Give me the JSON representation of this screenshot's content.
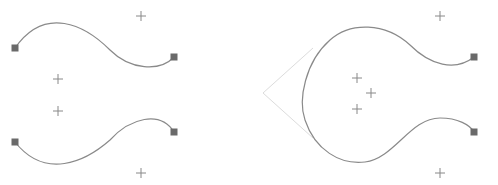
{
  "diagram": {
    "colors": {
      "curve": "#8a8a8a",
      "anchor": "#6a6a6a",
      "control_cross": "#888888",
      "guide_line": "#d8d8d8",
      "background": "#ffffff"
    },
    "left_panel": {
      "curves": [
        {
          "p0": [
            15,
            48
          ],
          "c1": [
            57,
            -10
          ],
          "c2": [
            140,
            107
          ],
          "p1": [
            174,
            57
          ],
          "path": "M15,48 C45,5 85,25 110,50 C130,70 160,72 174,57"
        },
        {
          "p0": [
            15,
            142
          ],
          "c1": [
            57,
            195
          ],
          "c2": [
            140,
            80
          ],
          "p1": [
            174,
            132
          ],
          "path": "M15,142 C45,180 85,162 110,140 C130,118 160,110 174,132"
        }
      ],
      "anchors": [
        [
          15,
          48
        ],
        [
          174,
          57
        ],
        [
          15,
          142
        ],
        [
          174,
          132
        ]
      ],
      "control_points": [
        [
          141,
          16
        ],
        [
          58,
          79
        ],
        [
          58,
          111
        ],
        [
          141,
          173
        ]
      ]
    },
    "right_panel": {
      "curves": [
        {
          "path": "M474,57 C455,72 430,60 412,45 C385,18 350,20 330,40 C308,62 300,95 305,118 C312,150 340,168 368,160 C390,153 410,120 430,120 C455,118 470,125 474,132"
        }
      ],
      "anchors": [
        [
          474,
          57
        ],
        [
          474,
          132
        ]
      ],
      "control_points": [
        [
          440,
          16
        ],
        [
          357,
          78
        ],
        [
          371,
          93
        ],
        [
          357,
          109
        ],
        [
          440,
          173
        ]
      ],
      "guide_lines": [
        [
          [
            263,
            93
          ],
          [
            313,
            48
          ]
        ],
        [
          [
            263,
            93
          ],
          [
            313,
            138
          ]
        ]
      ]
    }
  }
}
